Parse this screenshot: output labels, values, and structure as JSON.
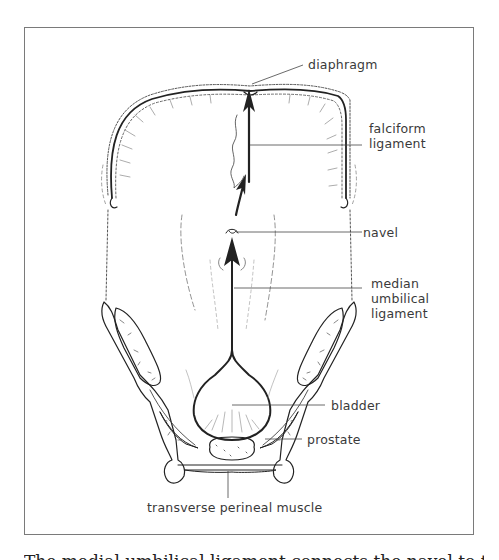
{
  "figure": {
    "labels": {
      "diaphragm": "diaphragm",
      "falciform": [
        "falciform",
        "ligament"
      ],
      "navel": "navel",
      "median_umbilical": [
        "median",
        "umbilical",
        "ligament"
      ],
      "bladder": "bladder",
      "prostate": "prostate",
      "transverse_perineal": "transverse perineal muscle"
    }
  },
  "caption": {
    "text": "The medial umbilical ligament connects the navel to the top of the"
  }
}
